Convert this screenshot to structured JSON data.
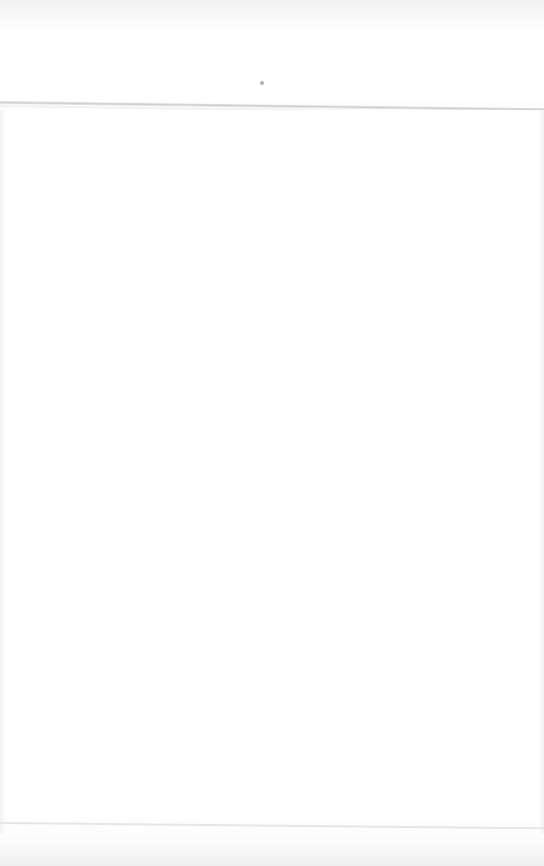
{
  "page": {
    "state": "blank",
    "loading_indicator": {
      "icon": "loading-dot-icon",
      "color": "#9a9a9a"
    }
  },
  "colors": {
    "background": "#ffffff",
    "divider": "#cfcfcf",
    "edge_shading": "#f1f1f1"
  }
}
